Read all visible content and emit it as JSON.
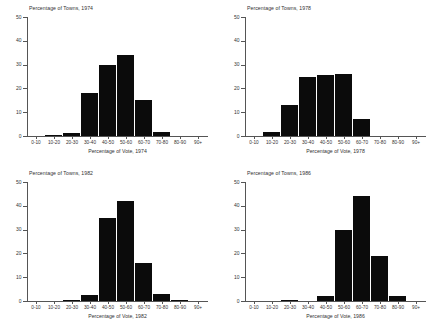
{
  "figure": {
    "name": "histogram-grid-percentage-of-vote-by-year",
    "panel_count": 4
  },
  "chart_data": [
    {
      "type": "bar",
      "title": "Percentage of Towns, 1974",
      "xlabel": "Percentage of Vote, 1974",
      "ylabel": "",
      "categories": [
        "0-10",
        "10-20",
        "20-30",
        "30-40",
        "40-50",
        "50-60",
        "60-70",
        "70-80",
        "80-90",
        "90+"
      ],
      "values": [
        0,
        0.3,
        1.2,
        18,
        30,
        34,
        15,
        1.7,
        0,
        0
      ],
      "ylim": [
        0,
        50
      ],
      "yticks": [
        0,
        10,
        20,
        30,
        40,
        50
      ],
      "grid": false,
      "legend": "none"
    },
    {
      "type": "bar",
      "title": "Percentage of Towns, 1978",
      "xlabel": "Percentage of Vote, 1978",
      "ylabel": "",
      "categories": [
        "0-10",
        "10-20",
        "20-30",
        "30-40",
        "40-50",
        "50-60",
        "60-70",
        "70-80",
        "80-90",
        "90+"
      ],
      "values": [
        0,
        1.8,
        13,
        25,
        25.5,
        26,
        7,
        0,
        0,
        0
      ],
      "ylim": [
        0,
        50
      ],
      "yticks": [
        0,
        10,
        20,
        30,
        40,
        50
      ],
      "grid": false,
      "legend": "none"
    },
    {
      "type": "bar",
      "title": "Percentage of Towns, 1982",
      "xlabel": "Percentage of Vote, 1982",
      "ylabel": "",
      "categories": [
        "0-10",
        "10-20",
        "20-30",
        "30-40",
        "40-50",
        "50-60",
        "60-70",
        "70-80",
        "80-90",
        "90+"
      ],
      "values": [
        0,
        0,
        0.5,
        2.5,
        35,
        42,
        16,
        3,
        0.3,
        0
      ],
      "ylim": [
        0,
        50
      ],
      "yticks": [
        0,
        10,
        20,
        30,
        40,
        50
      ],
      "grid": false,
      "legend": "none"
    },
    {
      "type": "bar",
      "title": "Percentage of Towns, 1986",
      "xlabel": "Percentage of Vote, 1986",
      "ylabel": "",
      "categories": [
        "0-10",
        "10-20",
        "20-30",
        "30-40",
        "40-50",
        "50-60",
        "60-70",
        "70-80",
        "80-90",
        "90+"
      ],
      "values": [
        0,
        0,
        0.3,
        0,
        2,
        30,
        44,
        19,
        2,
        0
      ],
      "ylim": [
        0,
        50
      ],
      "yticks": [
        0,
        10,
        20,
        30,
        40,
        50
      ],
      "grid": false,
      "legend": "none"
    }
  ],
  "colors": {
    "bar": "#0b0b0b",
    "axis": "#555555",
    "text": "#333333",
    "background": "#ffffff"
  }
}
